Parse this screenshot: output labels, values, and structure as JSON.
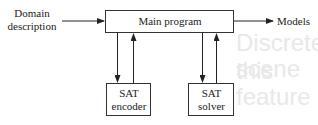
{
  "diagram": {
    "input": {
      "line1": "Domain",
      "line2": "description"
    },
    "main": {
      "label": "Main program"
    },
    "output": {
      "label": "Models"
    },
    "encoder": {
      "line1": "SAT",
      "line2": "encoder"
    },
    "solver": {
      "line1": "SAT",
      "line2": "solver"
    }
  },
  "background": {
    "line1": "Discrete scene",
    "line2": "this feature"
  }
}
